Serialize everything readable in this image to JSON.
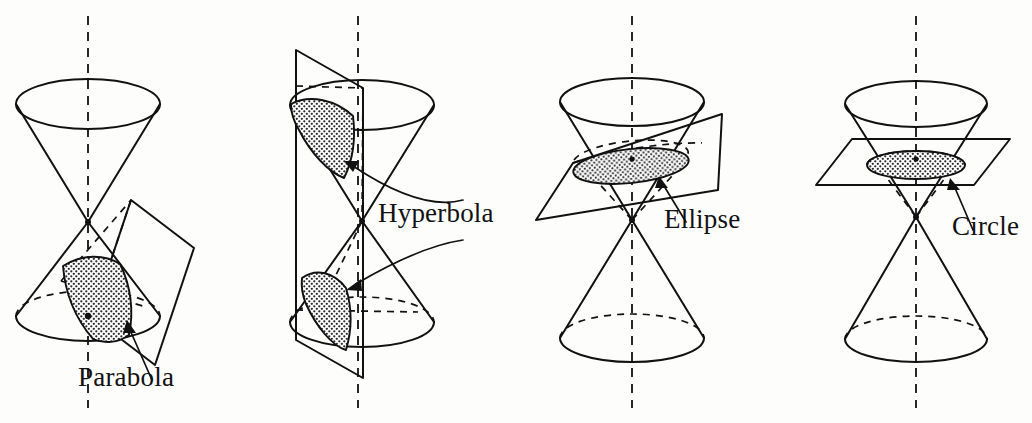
{
  "figure": {
    "background_color": "#fdfdfc",
    "ink_color": "#111111",
    "stipple_fill_color": "#cfcfcf",
    "panel_count": 4
  },
  "panels": [
    {
      "id": "parabola",
      "label": "Parabola",
      "label_x": 78,
      "label_y": 386,
      "axis_x": 88,
      "axis_label": "axis of the cone",
      "plane_orientation": "oblique, parallel to one slant side",
      "section_shape": "parabola",
      "shaded": true
    },
    {
      "id": "hyperbola",
      "label": "Hyperbola",
      "label_x": 120,
      "label_y": 222,
      "axis_x": 100,
      "axis_label": "axis of the cone",
      "plane_orientation": "vertical, parallel to the cone axis",
      "section_shape": "hyperbola (two branches)",
      "shaded": true
    },
    {
      "id": "ellipse",
      "label": "Ellipse",
      "label_x": 148,
      "label_y": 228,
      "axis_x": 116,
      "axis_label": "axis of the cone",
      "plane_orientation": "oblique, cutting only the upper nappe",
      "section_shape": "ellipse",
      "shaded": true
    },
    {
      "id": "circle",
      "label": "Circle",
      "label_x": 178,
      "label_y": 235,
      "axis_x": 142,
      "axis_label": "axis of the cone",
      "plane_orientation": "horizontal, perpendicular to the cone axis",
      "section_shape": "circle",
      "shaded": true
    }
  ]
}
